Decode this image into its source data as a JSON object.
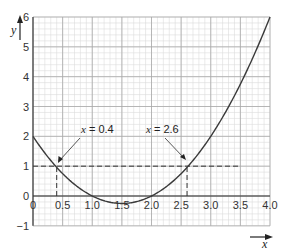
{
  "chart_data": {
    "type": "line",
    "title": "",
    "xlabel": "x",
    "ylabel": "y",
    "xlim": [
      0,
      4.0
    ],
    "ylim": [
      -1,
      6
    ],
    "grid": true,
    "x_ticks": [
      "0",
      "0.5",
      "1.0",
      "1.5",
      "2.0",
      "2.5",
      "3.0",
      "3.5",
      "4.0"
    ],
    "x_tick_values": [
      0,
      0.5,
      1.0,
      1.5,
      2.0,
      2.5,
      3.0,
      3.5,
      4.0
    ],
    "y_ticks": [
      "−1",
      "0",
      "1",
      "2",
      "3",
      "4",
      "5",
      "6"
    ],
    "y_tick_values": [
      -1,
      0,
      1,
      2,
      3,
      4,
      5,
      6
    ],
    "series": [
      {
        "name": "y = x² − 3x + 2",
        "x": [
          0,
          0.25,
          0.5,
          0.75,
          1.0,
          1.25,
          1.5,
          1.75,
          2.0,
          2.25,
          2.5,
          2.75,
          3.0,
          3.25,
          3.5,
          3.75,
          4.0
        ],
        "values": [
          2,
          1.3125,
          0.75,
          0.3125,
          0,
          -0.1875,
          -0.25,
          -0.1875,
          0,
          0.3125,
          0.75,
          1.3125,
          2,
          2.8125,
          3.75,
          4.8125,
          6
        ]
      }
    ],
    "reference_lines": [
      {
        "type": "horizontal",
        "y": 1,
        "x_from": 0,
        "x_to": 3.5,
        "style": "dashed"
      },
      {
        "type": "vertical",
        "x": 0.4,
        "y_from": 0,
        "y_to": 1,
        "style": "dashed"
      },
      {
        "type": "vertical",
        "x": 2.6,
        "y_from": 0,
        "y_to": 1,
        "style": "dashed"
      }
    ],
    "annotations": [
      {
        "text": "x = 0.4",
        "points_to": [
          0.4,
          1
        ]
      },
      {
        "text": "x = 2.6",
        "points_to": [
          2.6,
          1
        ]
      }
    ]
  },
  "labels": {
    "y_axis": "y",
    "x_axis": "x",
    "annot_left": "x = 0.4",
    "annot_right": "x = 2.6"
  }
}
